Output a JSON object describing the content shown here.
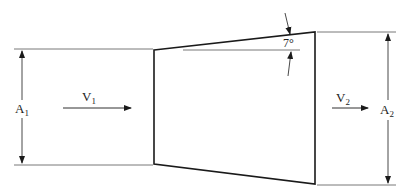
{
  "diagram": {
    "inlet": {
      "area_label": "A",
      "area_subscript": "1",
      "velocity_label": "V",
      "velocity_subscript": "1"
    },
    "outlet": {
      "area_label": "A",
      "area_subscript": "2",
      "velocity_label": "V",
      "velocity_subscript": "2"
    },
    "angle_label": "7°",
    "colors": {
      "line": "#1a1a1a",
      "dimension_line": "#555555",
      "background": "#ffffff"
    }
  }
}
